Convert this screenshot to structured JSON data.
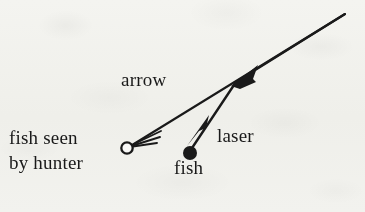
{
  "figure": {
    "background_color": "#f8f8f6",
    "ink_color": "#1a1a1a",
    "labels": {
      "arrow": "arrow",
      "laser": "laser",
      "fish": "fish",
      "fish_seen_line1": "fish seen",
      "fish_seen_line2": "by hunter"
    },
    "markers": {
      "fish_actual": {
        "name": "fish",
        "style": "filled-circle",
        "x": 190,
        "y": 153,
        "r": 7
      },
      "fish_apparent": {
        "name": "fish seen by hunter",
        "style": "open-circle",
        "x": 127,
        "y": 148,
        "r": 6
      }
    },
    "rays": [
      {
        "name": "arrow-ray",
        "label": "arrow",
        "from_x": 345,
        "from_y": 14,
        "to_x": 131,
        "to_y": 145,
        "arrowhead": "open-barbed",
        "arrowhead_at": "end",
        "note": "long straight ray from upper right down to the apparent fish position"
      },
      {
        "name": "laser-ray",
        "label": "laser",
        "from_x": 345,
        "from_y": 14,
        "to_x": 193,
        "to_y": 147,
        "bend_x": 236,
        "bend_y": 82,
        "arrowhead": "filled-wedge",
        "arrowhead_at": "bend-and-end",
        "note": "refracted ray: straight from upper right to the water surface point, then bent down to the real fish"
      }
    ]
  }
}
